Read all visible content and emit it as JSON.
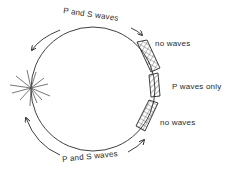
{
  "diagram": {
    "labels": {
      "top_arc": "P and S waves",
      "bottom_arc": "P and S waves",
      "zone_upper": "no waves",
      "zone_middle": "P waves only",
      "zone_lower": "no waves"
    },
    "elements": {
      "earth_circle": "Earth outline",
      "epicenter": "earthquake focus starburst"
    },
    "colors": {
      "stroke": "#2a2a2a",
      "background": "#ffffff"
    }
  }
}
